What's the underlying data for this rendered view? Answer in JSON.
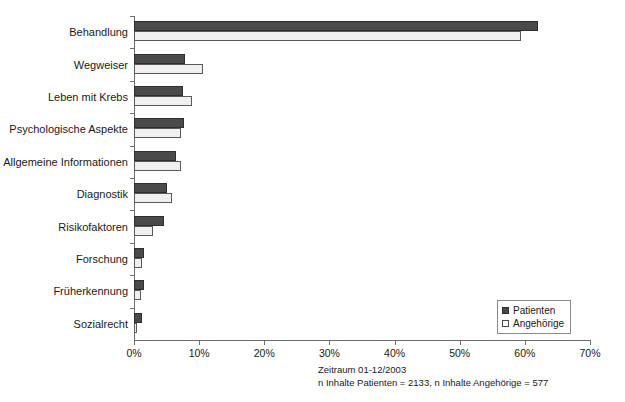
{
  "chart_data": {
    "type": "bar",
    "orientation": "horizontal",
    "title": "",
    "xlabel": "",
    "ylabel": "",
    "xlim": [
      0,
      70
    ],
    "xticks": [
      0,
      10,
      20,
      30,
      40,
      50,
      60,
      70
    ],
    "xtick_labels": [
      "0%",
      "10%",
      "20%",
      "30%",
      "40%",
      "50%",
      "60%",
      "70%"
    ],
    "grid": false,
    "legend_position": "bottom-right",
    "categories": [
      "Behandlung",
      "Wegweiser",
      "Leben mit Krebs",
      "Psychologische Aspekte",
      "Allgemeine Informationen",
      "Diagnostik",
      "Risikofaktoren",
      "Forschung",
      "Früherkennung",
      "Sozialrecht"
    ],
    "series": [
      {
        "name": "Patienten",
        "color": "#4a4a4a",
        "values": [
          62.0,
          7.9,
          7.5,
          7.7,
          6.5,
          5.1,
          4.6,
          1.6,
          1.5,
          1.3
        ]
      },
      {
        "name": "Angehörige",
        "color": "#f0f0f0",
        "values": [
          59.4,
          10.6,
          8.9,
          7.2,
          7.2,
          5.8,
          2.9,
          1.2,
          1.0,
          0.5
        ]
      }
    ],
    "annotations": [
      "Zeitraum 01-12/2003",
      "n Inhalte Patienten = 2133, n Inhalte Angehörige =  577"
    ]
  },
  "legend": {
    "items": [
      {
        "label": "Patienten"
      },
      {
        "label": "Angehörige"
      }
    ]
  },
  "footnotes": {
    "line1": "Zeitraum 01-12/2003",
    "line2": "n Inhalte Patienten = 2133, n Inhalte Angehörige =  577"
  }
}
